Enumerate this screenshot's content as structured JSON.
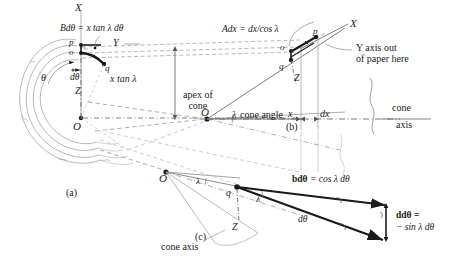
{
  "figure": {
    "panels": [
      {
        "id": "a",
        "caption": "(a)"
      },
      {
        "id": "b",
        "caption": "(b)"
      },
      {
        "id": "c",
        "caption": "(c)"
      }
    ]
  },
  "panel_a": {
    "axis_X": "X",
    "axis_Y": "Y",
    "axis_Z": "Z",
    "point_p": "p",
    "point_o": "o",
    "point_q": "q",
    "point_O": "O",
    "angle_theta": "θ",
    "d_theta": "dθ",
    "formula_B": "Bdθ = x tan λ dθ",
    "x_tan_lambda": "x tan λ",
    "caption": "(a)"
  },
  "panel_b": {
    "axis_X": "X",
    "axis_Z": "Z",
    "point_p": "p",
    "point_o": "o",
    "point_q": "q",
    "point_O": "O",
    "formula_A": "Adx = dx/cos λ",
    "y_axis_note": "Y axis out\nof paper here",
    "apex_label": "apex of\ncone",
    "cone_angle_lambda": "λ",
    "cone_angle_text": "cone angle",
    "dim_x": "x",
    "dim_dx": "dx",
    "cone_axis_top": "cone",
    "cone_axis_bottom": "axis",
    "caption": "(b)"
  },
  "panel_c": {
    "point_O": "O",
    "point_q": "q",
    "axis_Z": "Z",
    "lambda_apex": "λ",
    "lambda_mid": "λ",
    "formula_b": "bdθ",
    "formula_b_rhs": " = cos λ dθ",
    "d_theta": "dθ",
    "formula_d_line1": "ddθ =",
    "formula_d_line2": "− sin λ dθ",
    "cone_axis": "cone axis",
    "caption": "(c)"
  },
  "colors": {
    "ink": "#1a1a1a",
    "light_line": "#8a8a8a",
    "faint_line": "#b3b3b3",
    "dashed": "#9a9a9a"
  }
}
